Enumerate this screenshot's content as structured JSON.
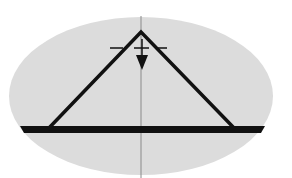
{
  "diagram": {
    "colors": {
      "background": "#ffffff",
      "ellipse_fill": "#dcdcdc",
      "stroke": "#111111",
      "axis": "#8a8a8a"
    },
    "elements": [
      "grey-ellipse",
      "vertical-axis",
      "triangle-truss",
      "base-bar",
      "apex-tick-line",
      "load-arrow"
    ]
  }
}
